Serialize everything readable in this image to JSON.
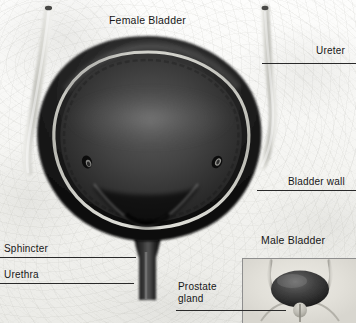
{
  "figure": {
    "style": "grayscale medical cutaway"
  },
  "main_diagram": {
    "title": "Female Bladder",
    "parts": [
      {
        "name": "ureter",
        "label": "Ureter"
      },
      {
        "name": "bladder-wall",
        "label": "Bladder wall"
      },
      {
        "name": "sphincter",
        "label": "Sphincter"
      },
      {
        "name": "urethra",
        "label": "Urethra"
      }
    ]
  },
  "inset_diagram": {
    "title": "Male Bladder",
    "parts": [
      {
        "name": "prostate-gland",
        "label_line1": "Prostate",
        "label_line2": "gland"
      }
    ]
  },
  "colors": {
    "background": "#f4f4f1",
    "wall_dark": "#171717",
    "wall_mid": "#3a3a3a",
    "lining_light": "#cfcfc8",
    "lumen": "#2e2e2e",
    "ureter_pale": "#c9c9c4",
    "inset_bg": "#e4e2db",
    "leader_line": "#2a2a2a",
    "text": "#171717"
  }
}
